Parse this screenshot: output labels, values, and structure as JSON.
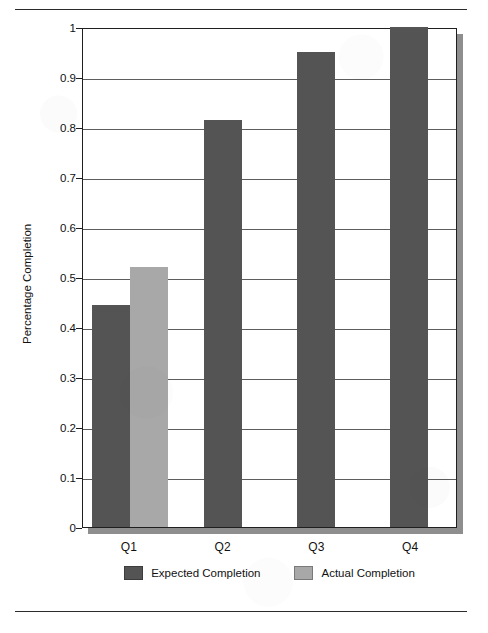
{
  "page": {
    "top_caption": "",
    "background": "#ffffff",
    "rule_color": "#2b2b2b"
  },
  "colors": {
    "expected": "#545454",
    "actual": "#a8a8a8",
    "axis": "#1f1f1f",
    "gridline": "#5d5d5d",
    "plot_shadow": "#8e8e8e",
    "text": "#111111"
  },
  "chart_data": {
    "type": "bar",
    "title": "",
    "xlabel": "",
    "ylabel": "Percentage Completion",
    "categories": [
      "Q1",
      "Q2",
      "Q3",
      "Q4"
    ],
    "series": [
      {
        "name": "Expected Completion",
        "color": "#545454",
        "values": [
          0.445,
          0.815,
          0.95,
          1.0
        ]
      },
      {
        "name": "Actual Completion",
        "color": "#a8a8a8",
        "values": [
          0.52,
          null,
          null,
          null
        ]
      }
    ],
    "ylim": [
      0,
      1
    ],
    "ytick_labels": [
      "1",
      "0.9",
      "0.8",
      "0.7",
      "0.6",
      "0.5",
      "0.4",
      "0.3",
      "0.2",
      "0.1",
      "0"
    ],
    "ytick_values": [
      1,
      0.9,
      0.8,
      0.7,
      0.6,
      0.5,
      0.4,
      0.3,
      0.2,
      0.1,
      0
    ],
    "grid": true,
    "grid_axis": "y",
    "legend_position": "bottom"
  },
  "legend": {
    "items": [
      {
        "label": "Expected Completion",
        "color": "#545454"
      },
      {
        "label": "Actual Completion",
        "color": "#a8a8a8"
      }
    ]
  }
}
